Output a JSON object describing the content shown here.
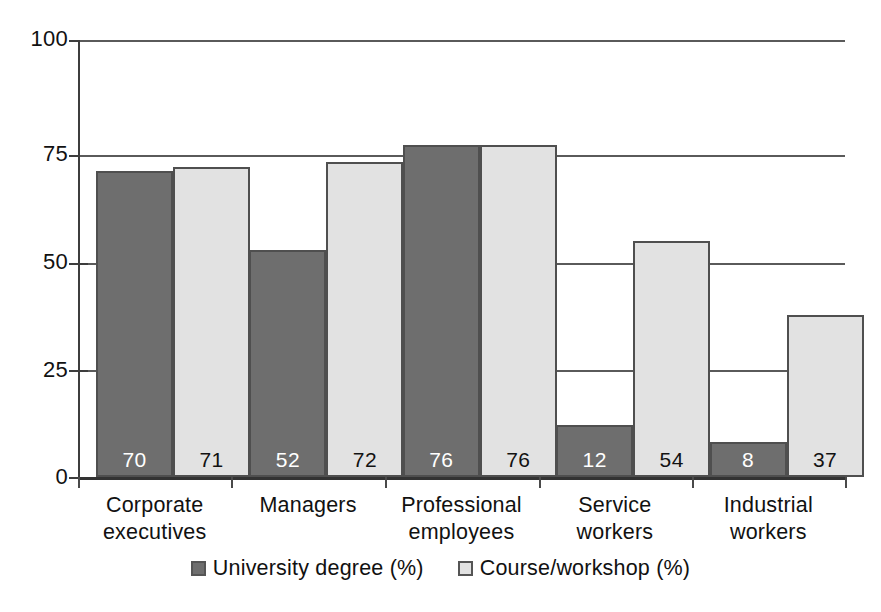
{
  "chart_data": {
    "type": "bar",
    "title": "",
    "subtitle": "",
    "xlabel": "",
    "ylabel": "",
    "ylim": [
      0,
      100
    ],
    "yticks": [
      "0",
      "25",
      "50",
      "75",
      "100"
    ],
    "grid": "horizontal",
    "legend_position": "bottom-center",
    "categories": [
      "Corporate executives",
      "Managers",
      "Professional employees",
      "Service workers",
      "Industrial workers"
    ],
    "category_lines": [
      [
        "Corporate",
        "executives"
      ],
      [
        "Managers",
        ""
      ],
      [
        "Professional",
        "employees"
      ],
      [
        "Service",
        "workers"
      ],
      [
        "Industrial",
        "workers"
      ]
    ],
    "series": [
      {
        "name": "University degree (%)",
        "color": "#6e6e6e",
        "values": [
          70,
          52,
          76,
          12,
          8
        ],
        "labels": [
          "70",
          "52",
          "76",
          "12",
          "8"
        ]
      },
      {
        "name": "Course/workshop (%)",
        "color": "#e2e2e2",
        "values": [
          71,
          72,
          76,
          54,
          37
        ],
        "labels": [
          "71",
          "72",
          "76",
          "54",
          "37"
        ]
      }
    ],
    "annotations": []
  },
  "legend": {
    "items": [
      {
        "label": "University degree (%)"
      },
      {
        "label": "Course/workshop (%)"
      }
    ]
  },
  "axis": {
    "y_tick_labels": [
      "100",
      "75",
      "50",
      "25",
      "0"
    ]
  }
}
